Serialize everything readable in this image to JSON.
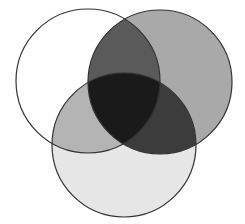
{
  "diagram": {
    "type": "venn",
    "sets": [
      {
        "id": "left",
        "cx": 88,
        "cy": 81,
        "r": 72,
        "fill": "#ffffff"
      },
      {
        "id": "right",
        "cx": 160,
        "cy": 82,
        "r": 72,
        "fill": "#a9a9a9"
      },
      {
        "id": "bottom",
        "cx": 124,
        "cy": 145,
        "r": 72,
        "fill": "#e6e6e6"
      }
    ],
    "regions": {
      "left_right": "#5a5a5a",
      "left_bottom": "#b4b4b4",
      "right_bottom": "#3c3c3c",
      "all_three": "#1a1a1a"
    },
    "stroke": "#333333"
  }
}
